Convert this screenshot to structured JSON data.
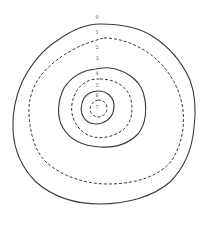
{
  "diagram": {
    "contour_labels": [
      "0",
      "1",
      "2",
      "3",
      "4",
      "5",
      "6",
      "7"
    ],
    "contours": [
      {
        "level": "1",
        "style": "solid"
      },
      {
        "level": "2",
        "style": "dashed"
      },
      {
        "level": "4",
        "style": "solid"
      },
      {
        "level": "5",
        "style": "dashed"
      },
      {
        "level": "6",
        "style": "solid"
      },
      {
        "level": "7",
        "style": "dashed"
      }
    ],
    "line_color": "#3a3a3a"
  }
}
